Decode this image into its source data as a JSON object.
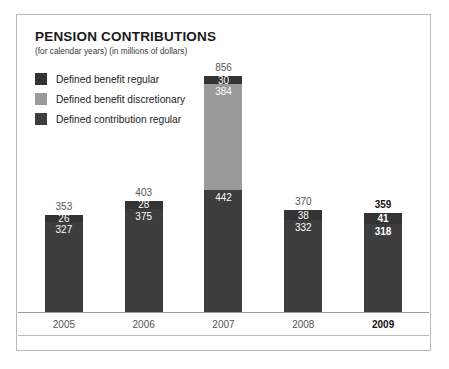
{
  "header": {
    "title": "PENSION CONTRIBUTIONS",
    "subtitle": "(for calendar years) (in millions of dollars)"
  },
  "colors": {
    "defined_benefit_regular": "#333333",
    "defined_benefit_discretionary": "#9a9a9a",
    "defined_contribution_regular": "#3d3d3d",
    "frame_border": "#b8b8b8",
    "axis_line": "#9b9b9b",
    "label_text": "#555555",
    "highlight_text": "#111111"
  },
  "legend": {
    "items": [
      {
        "label": "Defined benefit regular",
        "color": "#333333"
      },
      {
        "label": "Defined benefit discretionary",
        "color": "#9a9a9a"
      },
      {
        "label": "Defined contribution regular",
        "color": "#3d3d3d"
      }
    ]
  },
  "chart_data": {
    "type": "bar",
    "subtype": "stacked-column",
    "title": "PENSION CONTRIBUTIONS",
    "subtitle": "(for calendar years) (in millions of dollars)",
    "xlabel": "",
    "ylabel": "",
    "unit": "millions of dollars",
    "grid": false,
    "legend_position": "top-left",
    "categories": [
      "2005",
      "2006",
      "2007",
      "2008",
      "2009"
    ],
    "highlighted_category": "2009",
    "ylim": [
      0,
      856
    ],
    "series": [
      {
        "name": "Defined contribution regular",
        "color": "#3d3d3d",
        "values": [
          327,
          375,
          442,
          332,
          318
        ]
      },
      {
        "name": "Defined benefit regular",
        "color": "#333333",
        "values": [
          26,
          28,
          30,
          38,
          41
        ]
      },
      {
        "name": "Defined benefit discretionary",
        "color": "#9a9a9a",
        "values": [
          0,
          0,
          384,
          0,
          0
        ]
      }
    ],
    "totals": [
      353,
      403,
      856,
      370,
      359
    ],
    "bars": [
      {
        "year": "2005",
        "total": "353",
        "bold": false,
        "segments": [
          {
            "name": "defined-benefit-discretionary",
            "value": 0,
            "label": "",
            "color": "#9a9a9a"
          },
          {
            "name": "defined-benefit-regular",
            "value": 26,
            "label": "26",
            "color": "#333333"
          },
          {
            "name": "defined-contribution-regular",
            "value": 327,
            "label": "327",
            "color": "#3d3d3d"
          }
        ]
      },
      {
        "year": "2006",
        "total": "403",
        "bold": false,
        "segments": [
          {
            "name": "defined-benefit-discretionary",
            "value": 0,
            "label": "",
            "color": "#9a9a9a"
          },
          {
            "name": "defined-benefit-regular",
            "value": 28,
            "label": "28",
            "color": "#333333"
          },
          {
            "name": "defined-contribution-regular",
            "value": 375,
            "label": "375",
            "color": "#3d3d3d"
          }
        ]
      },
      {
        "year": "2007",
        "total": "856",
        "bold": false,
        "segments": [
          {
            "name": "defined-benefit-regular",
            "value": 30,
            "label": "30",
            "color": "#333333"
          },
          {
            "name": "defined-benefit-discretionary",
            "value": 384,
            "label": "384",
            "color": "#9a9a9a"
          },
          {
            "name": "defined-contribution-regular",
            "value": 442,
            "label": "442",
            "color": "#3d3d3d"
          }
        ]
      },
      {
        "year": "2008",
        "total": "370",
        "bold": false,
        "segments": [
          {
            "name": "defined-benefit-discretionary",
            "value": 0,
            "label": "",
            "color": "#9a9a9a"
          },
          {
            "name": "defined-benefit-regular",
            "value": 38,
            "label": "38",
            "color": "#333333"
          },
          {
            "name": "defined-contribution-regular",
            "value": 332,
            "label": "332",
            "color": "#3d3d3d"
          }
        ]
      },
      {
        "year": "2009",
        "total": "359",
        "bold": true,
        "segments": [
          {
            "name": "defined-benefit-discretionary",
            "value": 0,
            "label": "",
            "color": "#9a9a9a"
          },
          {
            "name": "defined-benefit-regular",
            "value": 41,
            "label": "41",
            "color": "#333333"
          },
          {
            "name": "defined-contribution-regular",
            "value": 318,
            "label": "318",
            "color": "#3d3d3d"
          }
        ]
      }
    ]
  },
  "axis": {
    "labels": [
      {
        "text": "2005",
        "bold": false
      },
      {
        "text": "2006",
        "bold": false
      },
      {
        "text": "2007",
        "bold": false
      },
      {
        "text": "2008",
        "bold": false
      },
      {
        "text": "2009",
        "bold": true
      }
    ]
  }
}
